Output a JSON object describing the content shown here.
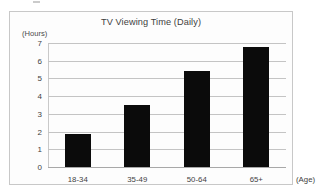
{
  "chart_data": {
    "type": "bar",
    "title": "TV Viewing Time (Daily)",
    "categories": [
      "18-34",
      "35-49",
      "50-64",
      "65+"
    ],
    "values": [
      1.85,
      3.5,
      5.4,
      6.8
    ],
    "xlabel": "(Age)",
    "ylabel": "(Hours)",
    "ylim": [
      0,
      7
    ],
    "yticks": [
      "0",
      "1",
      "2",
      "3",
      "4",
      "5",
      "6",
      "7"
    ],
    "grid": true,
    "legend": false,
    "bar_color": "#0b0b0b",
    "gridline_color": "#c4c4c4"
  }
}
